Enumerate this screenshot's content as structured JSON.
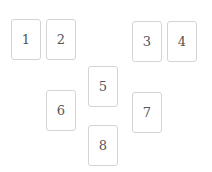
{
  "board": {
    "cards": [
      {
        "label": "1",
        "x": 11,
        "y": 19
      },
      {
        "label": "2",
        "x": 46,
        "y": 19
      },
      {
        "label": "3",
        "x": 132,
        "y": 21
      },
      {
        "label": "4",
        "x": 167,
        "y": 21
      },
      {
        "label": "5",
        "x": 88,
        "y": 66
      },
      {
        "label": "6",
        "x": 46,
        "y": 90
      },
      {
        "label": "7",
        "x": 132,
        "y": 92
      },
      {
        "label": "8",
        "x": 88,
        "y": 125
      }
    ]
  }
}
